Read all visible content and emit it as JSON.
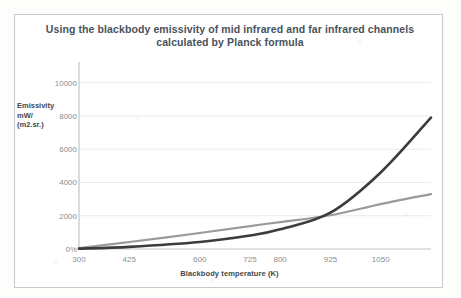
{
  "figure": {
    "title_line1": "Using the blackbody emissivity of mid infrared and far infrared channels",
    "title_line2": "calculated by Planck formula",
    "border_color": "#c9c9c9",
    "background": "#ffffff"
  },
  "axes": {
    "y_title_line1": "Emissivity",
    "y_title_line2": "mW/",
    "y_title_line3": "(m2.sr.)",
    "x_title": "Blackbody temperature  (K)"
  },
  "chart_data": {
    "type": "line",
    "title": "Using the blackbody emissivity of mid infrared and far infrared channels calculated by Planck formula",
    "xlabel": "Blackbody temperature  (K)",
    "ylabel": "Emissivity mW/ (m2.sr.)",
    "xlim": [
      300,
      1175
    ],
    "ylim": [
      0,
      11000
    ],
    "grid": true,
    "legend": "none",
    "x_tick_labels": [
      "300",
      "425",
      "600",
      "725",
      "800",
      "925",
      "1050"
    ],
    "x_tick_values": [
      300,
      425,
      600,
      725,
      800,
      925,
      1050
    ],
    "y_tick_labels": [
      "0%",
      "2000",
      "4000",
      "6000",
      "8000",
      "10000"
    ],
    "y_tick_values": [
      0,
      2000,
      4000,
      6000,
      8000,
      10000
    ],
    "x": [
      300,
      425,
      600,
      725,
      800,
      925,
      1050,
      1175
    ],
    "series": [
      {
        "name": "far infrared channel",
        "color": "#9a9a9a",
        "width": 2.2,
        "values": [
          60,
          420,
          960,
          1380,
          1620,
          2030,
          2700,
          3300
        ]
      },
      {
        "name": "mid infrared channel",
        "color": "#3c3c3c",
        "width": 2.6,
        "values": [
          20,
          130,
          420,
          810,
          1180,
          2180,
          4600,
          7900
        ]
      }
    ]
  }
}
